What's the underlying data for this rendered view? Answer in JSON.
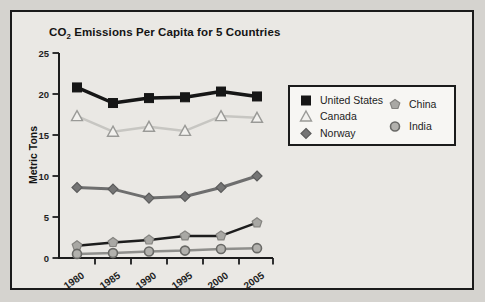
{
  "figure": {
    "title_prefix": "CO",
    "title_sub": "2",
    "title_rest": " Emissions Per Capita for 5 Countries",
    "background": "#d5d3cf",
    "panel_background": "#eae8e4",
    "border_color": "#1b1b1b",
    "legend_background": "#f7f6f3"
  },
  "chart_data": {
    "type": "line",
    "xlabel": "",
    "ylabel": "Metric Tons",
    "categories": [
      "1980",
      "1985",
      "1990",
      "1995",
      "2000",
      "2005"
    ],
    "ylim": [
      0,
      25
    ],
    "yticks": [
      0,
      5,
      10,
      15,
      20,
      25
    ],
    "grid": false,
    "legend_position": "right-inside",
    "series": [
      {
        "name": "United States",
        "marker": "square",
        "marker_size": 4.5,
        "line_color": "#161616",
        "marker_fill": "#161616",
        "marker_stroke": "#161616",
        "line_width": 3.5,
        "values": [
          20.8,
          18.9,
          19.5,
          19.6,
          20.3,
          19.7
        ]
      },
      {
        "name": "Canada",
        "marker": "triangle-open",
        "marker_size": 4.5,
        "line_color": "#c7c6c2",
        "marker_fill": "#f2f1ee",
        "marker_stroke": "#9a9a97",
        "line_width": 2.5,
        "values": [
          17.3,
          15.4,
          16.0,
          15.5,
          17.3,
          17.1
        ]
      },
      {
        "name": "Norway",
        "marker": "diamond",
        "marker_size": 4,
        "line_color": "#6e6e6e",
        "marker_fill": "#757575",
        "marker_stroke": "#5c5c5c",
        "line_width": 3,
        "values": [
          8.6,
          8.4,
          7.3,
          7.5,
          8.6,
          10.0
        ]
      },
      {
        "name": "China",
        "marker": "pentagon",
        "marker_size": 4.5,
        "line_color": "#1d1d1d",
        "marker_fill": "#a9a8a4",
        "marker_stroke": "#858480",
        "line_width": 2.5,
        "values": [
          1.5,
          1.9,
          2.2,
          2.7,
          2.7,
          4.3
        ]
      },
      {
        "name": "India",
        "marker": "circle",
        "marker_size": 4.5,
        "line_color": "#8f8f8c",
        "marker_fill": "#b2b1ad",
        "marker_stroke": "#696966",
        "line_width": 2.5,
        "values": [
          0.5,
          0.6,
          0.8,
          0.9,
          1.1,
          1.2
        ]
      }
    ],
    "legend_columns": [
      [
        "United States",
        "Canada",
        "Norway"
      ],
      [
        "China",
        "India"
      ]
    ]
  }
}
